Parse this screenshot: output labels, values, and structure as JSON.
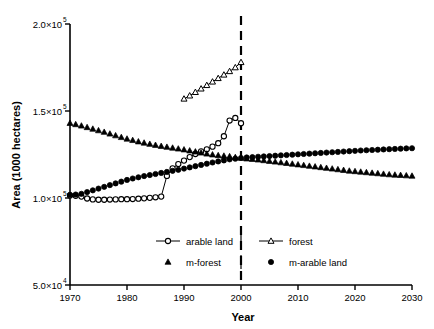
{
  "chart_data": {
    "type": "line",
    "title": "",
    "xlabel": "Year",
    "ylabel": "Area (1000 hectares)",
    "xlim": [
      1970,
      2030
    ],
    "ylim": [
      50000,
      200000
    ],
    "grid": false,
    "legend_position": "lower-center",
    "xticks": [
      1970,
      1980,
      1990,
      2000,
      2010,
      2020,
      2030
    ],
    "xtick_labels": [
      "1970",
      "1980",
      "1990",
      "2000",
      "2010",
      "2020",
      "2030"
    ],
    "yticks": [
      50000,
      100000,
      150000,
      200000
    ],
    "ytick_labels": [
      "5.0×10",
      "1.0×10",
      "1.5×10",
      "2.0×10"
    ],
    "ytick_exponents": [
      "4",
      "5",
      "5",
      "5"
    ],
    "annotations": [
      {
        "name": "vertical-divider",
        "type": "vline",
        "x": 2000,
        "style": "dashed",
        "label": ""
      }
    ],
    "series": [
      {
        "name": "arable land",
        "marker": "open-circle",
        "line": true,
        "x": [
          1970,
          1971,
          1972,
          1973,
          1974,
          1975,
          1976,
          1977,
          1978,
          1979,
          1980,
          1981,
          1982,
          1983,
          1984,
          1985,
          1986,
          1987,
          1988,
          1989,
          1990,
          1991,
          1992,
          1993,
          1994,
          1995,
          1996,
          1997,
          1998,
          1999,
          2000
        ],
        "y": [
          101500,
          101300,
          100800,
          99700,
          99200,
          99000,
          99000,
          99100,
          99200,
          99300,
          99300,
          99400,
          99600,
          99800,
          100100,
          100400,
          100800,
          112700,
          117000,
          119500,
          121500,
          123500,
          125300,
          126800,
          128000,
          129500,
          131500,
          135500,
          144500,
          146000,
          143000
        ]
      },
      {
        "name": "forest",
        "marker": "open-triangle",
        "line": true,
        "x": [
          1990,
          1991,
          1992,
          1993,
          1994,
          1995,
          1996,
          1997,
          1998,
          1999,
          2000
        ],
        "y": [
          157000,
          158800,
          160800,
          162800,
          164800,
          166800,
          168800,
          170800,
          172800,
          175000,
          178000
        ]
      },
      {
        "name": "m-forest",
        "marker": "filled-triangle",
        "line": false,
        "x": [
          1970,
          1971,
          1972,
          1973,
          1974,
          1975,
          1976,
          1977,
          1978,
          1979,
          1980,
          1981,
          1982,
          1983,
          1984,
          1985,
          1986,
          1987,
          1988,
          1989,
          1990,
          1991,
          1992,
          1993,
          1994,
          1995,
          1996,
          1997,
          1998,
          1999,
          2000,
          2001,
          2002,
          2003,
          2004,
          2005,
          2006,
          2007,
          2008,
          2009,
          2010,
          2011,
          2012,
          2013,
          2014,
          2015,
          2016,
          2017,
          2018,
          2019,
          2020,
          2021,
          2022,
          2023,
          2024,
          2025,
          2026,
          2027,
          2028,
          2029,
          2030
        ],
        "y": [
          143000,
          142300,
          141500,
          140600,
          139700,
          138800,
          137900,
          136900,
          135900,
          134900,
          134000,
          133200,
          132400,
          131700,
          131000,
          130400,
          129800,
          129300,
          128800,
          128300,
          127800,
          127200,
          126600,
          126000,
          125400,
          124900,
          124500,
          124200,
          123900,
          123400,
          123000,
          122600,
          122300,
          122000,
          121600,
          121200,
          120800,
          120400,
          120000,
          119600,
          119200,
          118800,
          118400,
          118000,
          117600,
          117200,
          116800,
          116400,
          116000,
          115600,
          115300,
          115000,
          114700,
          114400,
          114100,
          113800,
          113500,
          113300,
          113100,
          112900,
          112700
        ]
      },
      {
        "name": "m-arable land",
        "marker": "filled-circle",
        "line": false,
        "x": [
          1970,
          1971,
          1972,
          1973,
          1974,
          1975,
          1976,
          1977,
          1978,
          1979,
          1980,
          1981,
          1982,
          1983,
          1984,
          1985,
          1986,
          1987,
          1988,
          1989,
          1990,
          1991,
          1992,
          1993,
          1994,
          1995,
          1996,
          1997,
          1998,
          1999,
          2000,
          2001,
          2002,
          2003,
          2004,
          2005,
          2006,
          2007,
          2008,
          2009,
          2010,
          2011,
          2012,
          2013,
          2014,
          2015,
          2016,
          2017,
          2018,
          2019,
          2020,
          2021,
          2022,
          2023,
          2024,
          2025,
          2026,
          2027,
          2028,
          2029,
          2030
        ],
        "y": [
          101800,
          102000,
          102400,
          103400,
          104400,
          105400,
          106400,
          107400,
          108400,
          109400,
          110400,
          111200,
          111900,
          112600,
          113200,
          113800,
          114400,
          115000,
          115600,
          116200,
          116900,
          117600,
          118300,
          119000,
          119700,
          120400,
          121000,
          121600,
          122200,
          122600,
          123000,
          123300,
          123500,
          123700,
          123900,
          124100,
          124300,
          124500,
          124700,
          124900,
          125100,
          125300,
          125500,
          125700,
          125900,
          126100,
          126300,
          126500,
          126700,
          126900,
          127100,
          127300,
          127450,
          127600,
          127750,
          127900,
          128050,
          128200,
          128350,
          128500,
          128600
        ]
      }
    ]
  },
  "legend": {
    "entries": [
      {
        "label": "arable land",
        "marker": "open-circle",
        "line": true
      },
      {
        "label": "forest",
        "marker": "open-triangle",
        "line": true
      },
      {
        "label": "m-forest",
        "marker": "filled-triangle",
        "line": false
      },
      {
        "label": "m-arable land",
        "marker": "filled-circle",
        "line": false
      }
    ]
  },
  "colors": {
    "axis": "#000000",
    "series": "#000000",
    "background": "#ffffff"
  }
}
